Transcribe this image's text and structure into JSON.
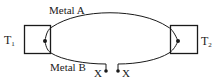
{
  "diagram": {
    "labels": {
      "metal_a": "Metal A",
      "metal_b": "Metal B",
      "t1_main": "T",
      "t1_sub": "1",
      "t2_main": "T",
      "t2_sub": "2",
      "x_left": "X",
      "x_right": "X"
    },
    "colors": {
      "stroke": "#1a1a1a",
      "background": "#ffffff"
    }
  }
}
